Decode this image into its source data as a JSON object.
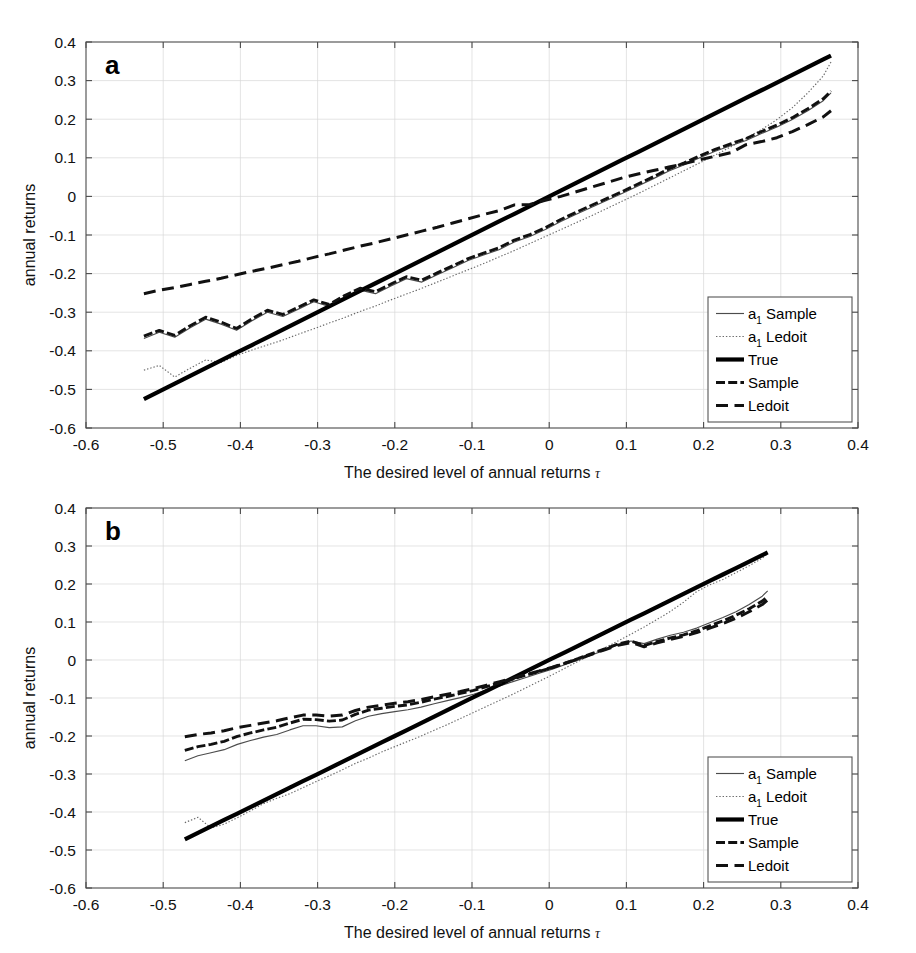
{
  "figure": {
    "background": "#ffffff",
    "width": 916,
    "height": 953,
    "series_colors": {
      "a1_sample": "#4c4c4c",
      "a1_ledoit": "#6a6a6a",
      "true": "#000000",
      "sample": "#111111",
      "ledoit": "#111111"
    }
  },
  "legend": {
    "position": "bottom-right",
    "entries": [
      {
        "label": "a",
        "sub": "1",
        "rest": " Sample",
        "style": "solid-thin",
        "key": "a1_sample"
      },
      {
        "label": "a",
        "sub": "1",
        "rest": " Ledoit",
        "style": "dotted-thin",
        "key": "a1_ledoit"
      },
      {
        "label": "True",
        "sub": "",
        "rest": "",
        "style": "solid-thick",
        "key": "true"
      },
      {
        "label": "Sample",
        "sub": "",
        "rest": "",
        "style": "dashed-short",
        "key": "sample"
      },
      {
        "label": "Ledoit",
        "sub": "",
        "rest": "",
        "style": "dashed-long",
        "key": "ledoit"
      }
    ]
  },
  "panels": [
    {
      "id": "a",
      "letter": "a"
    },
    {
      "id": "b",
      "letter": "b"
    }
  ],
  "chart_data": [
    {
      "type": "line",
      "panel": "a",
      "title": "",
      "xlabel": "The desired level of annual returns τ",
      "ylabel": "annual returns",
      "xlim": [
        -0.6,
        0.4
      ],
      "ylim": [
        -0.6,
        0.4
      ],
      "xticks": [
        -0.6,
        -0.5,
        -0.4,
        -0.3,
        -0.2,
        -0.1,
        0,
        0.1,
        0.2,
        0.3,
        0.4
      ],
      "xticklabels": [
        "-0.6",
        "-0.5",
        "-0.4",
        "-0.3",
        "-0.2",
        "-0.1",
        "0",
        "0.1",
        "0.2",
        "0.3",
        "0.4"
      ],
      "yticks": [
        -0.6,
        -0.5,
        -0.4,
        -0.3,
        -0.2,
        -0.1,
        0,
        0.1,
        0.2,
        0.3,
        0.4
      ],
      "yticklabels": [
        "-0.6",
        "-0.5",
        "-0.4",
        "-0.3",
        "-0.2",
        "-0.1",
        "0",
        "0.1",
        "0.2",
        "0.3",
        "0.4"
      ],
      "grid": true,
      "legend_position": "lower right",
      "x": [
        -0.525,
        -0.505,
        -0.485,
        -0.465,
        -0.445,
        -0.425,
        -0.405,
        -0.385,
        -0.365,
        -0.345,
        -0.325,
        -0.305,
        -0.285,
        -0.265,
        -0.245,
        -0.225,
        -0.205,
        -0.185,
        -0.165,
        -0.145,
        -0.125,
        -0.105,
        -0.085,
        -0.065,
        -0.045,
        -0.025,
        -0.005,
        0.015,
        0.035,
        0.055,
        0.075,
        0.095,
        0.115,
        0.135,
        0.155,
        0.175,
        0.195,
        0.215,
        0.235,
        0.255,
        0.275,
        0.295,
        0.315,
        0.335,
        0.355,
        0.365
      ],
      "series": [
        {
          "name": "a_1 Sample",
          "key": "a1_sample",
          "values": [
            -0.368,
            -0.352,
            -0.365,
            -0.34,
            -0.318,
            -0.331,
            -0.347,
            -0.322,
            -0.3,
            -0.311,
            -0.292,
            -0.273,
            -0.285,
            -0.262,
            -0.243,
            -0.252,
            -0.232,
            -0.213,
            -0.222,
            -0.203,
            -0.185,
            -0.166,
            -0.152,
            -0.138,
            -0.118,
            -0.104,
            -0.086,
            -0.065,
            -0.046,
            -0.028,
            -0.01,
            0.008,
            0.027,
            0.046,
            0.066,
            0.082,
            0.1,
            0.117,
            0.131,
            0.145,
            0.163,
            0.18,
            0.199,
            0.222,
            0.248,
            0.268
          ]
        },
        {
          "name": "a_1 Ledoit",
          "key": "a1_ledoit",
          "values": [
            -0.45,
            -0.438,
            -0.468,
            -0.445,
            -0.424,
            -0.43,
            -0.412,
            -0.398,
            -0.385,
            -0.372,
            -0.357,
            -0.343,
            -0.328,
            -0.314,
            -0.298,
            -0.284,
            -0.268,
            -0.253,
            -0.238,
            -0.222,
            -0.206,
            -0.19,
            -0.174,
            -0.157,
            -0.14,
            -0.122,
            -0.104,
            -0.086,
            -0.068,
            -0.05,
            -0.031,
            -0.012,
            0.007,
            0.027,
            0.047,
            0.067,
            0.087,
            0.107,
            0.128,
            0.15,
            0.173,
            0.199,
            0.23,
            0.268,
            0.312,
            0.348
          ]
        },
        {
          "name": "True",
          "key": "true",
          "values": [
            -0.525,
            -0.505,
            -0.485,
            -0.465,
            -0.445,
            -0.425,
            -0.405,
            -0.385,
            -0.365,
            -0.345,
            -0.325,
            -0.305,
            -0.285,
            -0.265,
            -0.245,
            -0.225,
            -0.205,
            -0.185,
            -0.165,
            -0.145,
            -0.125,
            -0.105,
            -0.085,
            -0.065,
            -0.045,
            -0.025,
            -0.005,
            0.015,
            0.035,
            0.055,
            0.075,
            0.095,
            0.115,
            0.135,
            0.155,
            0.175,
            0.195,
            0.215,
            0.235,
            0.255,
            0.275,
            0.295,
            0.315,
            0.335,
            0.355,
            0.365
          ]
        },
        {
          "name": "Sample",
          "key": "sample",
          "values": [
            -0.362,
            -0.347,
            -0.36,
            -0.335,
            -0.313,
            -0.326,
            -0.342,
            -0.317,
            -0.295,
            -0.306,
            -0.287,
            -0.268,
            -0.28,
            -0.257,
            -0.238,
            -0.247,
            -0.227,
            -0.208,
            -0.217,
            -0.198,
            -0.18,
            -0.161,
            -0.147,
            -0.133,
            -0.113,
            -0.099,
            -0.081,
            -0.06,
            -0.041,
            -0.023,
            -0.005,
            0.013,
            0.032,
            0.051,
            0.071,
            0.087,
            0.105,
            0.122,
            0.136,
            0.15,
            0.168,
            0.185,
            0.204,
            0.227,
            0.253,
            0.273
          ]
        },
        {
          "name": "Ledoit",
          "key": "ledoit",
          "values": [
            -0.252,
            -0.243,
            -0.236,
            -0.228,
            -0.22,
            -0.212,
            -0.203,
            -0.194,
            -0.186,
            -0.177,
            -0.168,
            -0.158,
            -0.149,
            -0.139,
            -0.129,
            -0.12,
            -0.11,
            -0.1,
            -0.09,
            -0.08,
            -0.069,
            -0.058,
            -0.047,
            -0.037,
            -0.022,
            -0.021,
            -0.01,
            0.0,
            0.012,
            0.024,
            0.036,
            0.048,
            0.058,
            0.067,
            0.076,
            0.085,
            0.095,
            0.104,
            0.113,
            0.134,
            0.142,
            0.152,
            0.168,
            0.186,
            0.206,
            0.222
          ]
        }
      ]
    },
    {
      "type": "line",
      "panel": "b",
      "title": "",
      "xlabel": "The desired level of annual returns τ",
      "ylabel": "annual returns",
      "xlim": [
        -0.6,
        0.4
      ],
      "ylim": [
        -0.6,
        0.4
      ],
      "xticks": [
        -0.6,
        -0.5,
        -0.4,
        -0.3,
        -0.2,
        -0.1,
        0,
        0.1,
        0.2,
        0.3,
        0.4
      ],
      "xticklabels": [
        "-0.6",
        "-0.5",
        "-0.4",
        "-0.3",
        "-0.2",
        "-0.1",
        "0",
        "0.1",
        "0.2",
        "0.3",
        "0.4"
      ],
      "yticks": [
        -0.6,
        -0.5,
        -0.4,
        -0.3,
        -0.2,
        -0.1,
        0,
        0.1,
        0.2,
        0.3,
        0.4
      ],
      "yticklabels": [
        "-0.6",
        "-0.5",
        "-0.4",
        "-0.3",
        "-0.2",
        "-0.1",
        "0",
        "0.1",
        "0.2",
        "0.3",
        "0.4"
      ],
      "grid": true,
      "legend_position": "lower right",
      "x": [
        -0.472,
        -0.455,
        -0.438,
        -0.421,
        -0.404,
        -0.387,
        -0.37,
        -0.353,
        -0.336,
        -0.319,
        -0.302,
        -0.285,
        -0.268,
        -0.251,
        -0.234,
        -0.217,
        -0.2,
        -0.183,
        -0.166,
        -0.149,
        -0.132,
        -0.115,
        -0.098,
        -0.081,
        -0.064,
        -0.047,
        -0.03,
        -0.013,
        0.004,
        0.021,
        0.038,
        0.055,
        0.072,
        0.089,
        0.106,
        0.123,
        0.14,
        0.157,
        0.174,
        0.191,
        0.208,
        0.225,
        0.242,
        0.259,
        0.276,
        0.283
      ],
      "series": [
        {
          "name": "a_1 Sample",
          "key": "a1_sample",
          "values": [
            -0.265,
            -0.252,
            -0.244,
            -0.236,
            -0.222,
            -0.212,
            -0.203,
            -0.196,
            -0.184,
            -0.173,
            -0.173,
            -0.178,
            -0.176,
            -0.16,
            -0.148,
            -0.141,
            -0.136,
            -0.131,
            -0.124,
            -0.115,
            -0.107,
            -0.099,
            -0.09,
            -0.079,
            -0.068,
            -0.057,
            -0.046,
            -0.035,
            -0.024,
            -0.012,
            0.0,
            0.013,
            0.026,
            0.04,
            0.05,
            0.043,
            0.055,
            0.065,
            0.073,
            0.084,
            0.098,
            0.112,
            0.127,
            0.146,
            0.168,
            0.182
          ]
        },
        {
          "name": "a_1 Ledoit",
          "key": "a1_ledoit",
          "values": [
            -0.428,
            -0.414,
            -0.442,
            -0.432,
            -0.415,
            -0.397,
            -0.378,
            -0.364,
            -0.352,
            -0.336,
            -0.32,
            -0.305,
            -0.289,
            -0.272,
            -0.258,
            -0.242,
            -0.228,
            -0.214,
            -0.2,
            -0.185,
            -0.17,
            -0.154,
            -0.138,
            -0.122,
            -0.106,
            -0.09,
            -0.073,
            -0.056,
            -0.039,
            -0.021,
            -0.003,
            0.014,
            0.032,
            0.05,
            0.068,
            0.087,
            0.107,
            0.128,
            0.152,
            0.18,
            0.198,
            0.212,
            0.23,
            0.248,
            0.268,
            0.28
          ]
        },
        {
          "name": "True",
          "key": "true",
          "values": [
            -0.472,
            -0.455,
            -0.438,
            -0.421,
            -0.404,
            -0.387,
            -0.37,
            -0.353,
            -0.336,
            -0.319,
            -0.302,
            -0.285,
            -0.268,
            -0.251,
            -0.234,
            -0.217,
            -0.2,
            -0.183,
            -0.166,
            -0.149,
            -0.132,
            -0.115,
            -0.098,
            -0.081,
            -0.064,
            -0.047,
            -0.03,
            -0.013,
            0.004,
            0.021,
            0.038,
            0.055,
            0.072,
            0.089,
            0.106,
            0.123,
            0.14,
            0.157,
            0.174,
            0.191,
            0.208,
            0.225,
            0.242,
            0.259,
            0.276,
            0.283
          ]
        },
        {
          "name": "Sample",
          "key": "sample",
          "values": [
            -0.238,
            -0.228,
            -0.222,
            -0.214,
            -0.201,
            -0.192,
            -0.184,
            -0.177,
            -0.166,
            -0.156,
            -0.157,
            -0.161,
            -0.158,
            -0.143,
            -0.132,
            -0.127,
            -0.122,
            -0.118,
            -0.111,
            -0.103,
            -0.096,
            -0.088,
            -0.08,
            -0.07,
            -0.06,
            -0.05,
            -0.04,
            -0.03,
            -0.02,
            -0.008,
            0.004,
            0.017,
            0.029,
            0.042,
            0.05,
            0.038,
            0.049,
            0.058,
            0.066,
            0.077,
            0.09,
            0.103,
            0.118,
            0.135,
            0.155,
            0.167
          ]
        },
        {
          "name": "Ledoit",
          "key": "ledoit",
          "values": [
            -0.202,
            -0.196,
            -0.192,
            -0.186,
            -0.178,
            -0.172,
            -0.166,
            -0.16,
            -0.152,
            -0.145,
            -0.145,
            -0.148,
            -0.145,
            -0.133,
            -0.124,
            -0.119,
            -0.114,
            -0.11,
            -0.104,
            -0.097,
            -0.09,
            -0.083,
            -0.075,
            -0.066,
            -0.057,
            -0.048,
            -0.038,
            -0.029,
            -0.019,
            -0.008,
            0.003,
            0.015,
            0.027,
            0.039,
            0.046,
            0.035,
            0.045,
            0.054,
            0.062,
            0.072,
            0.084,
            0.096,
            0.11,
            0.127,
            0.146,
            0.158
          ]
        }
      ]
    }
  ]
}
